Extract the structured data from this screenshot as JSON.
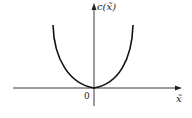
{
  "diagram": {
    "type": "function-plot",
    "y_axis_label": "c(x̃)",
    "x_axis_label": "x̃",
    "origin_label": "0",
    "curve": "convex U-shaped curve with minimum at origin",
    "colors": {
      "axes": "#222222",
      "curve": "#111111",
      "background": "#ffffff"
    }
  }
}
